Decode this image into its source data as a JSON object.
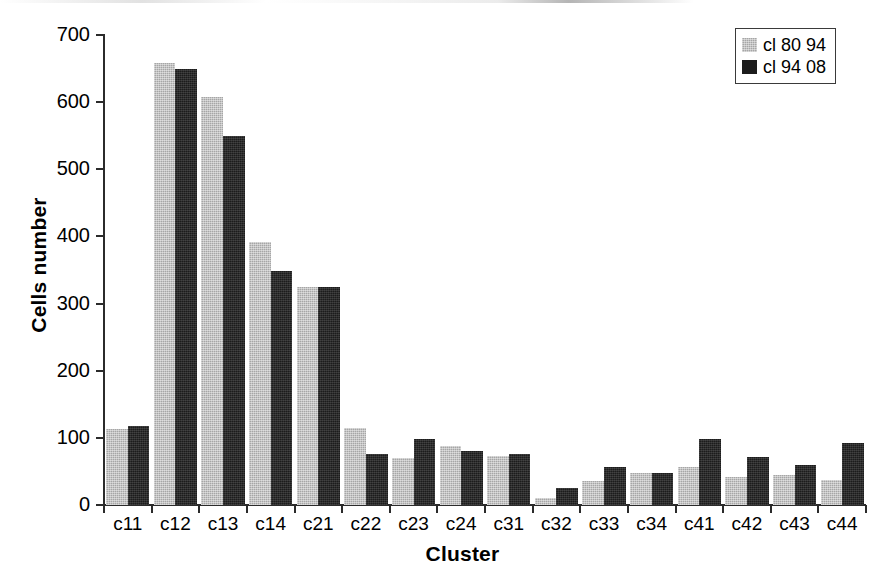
{
  "chart_data": {
    "type": "bar",
    "title": "",
    "xlabel": "Cluster",
    "ylabel": "Cells number",
    "ylim": [
      0,
      700
    ],
    "yticks": [
      0,
      100,
      200,
      300,
      400,
      500,
      600,
      700
    ],
    "grid": false,
    "legend_position": "top-right",
    "categories": [
      "c11",
      "c12",
      "c13",
      "c14",
      "c21",
      "c22",
      "c23",
      "c24",
      "c31",
      "c32",
      "c33",
      "c34",
      "c41",
      "c42",
      "c43",
      "c44"
    ],
    "series": [
      {
        "name": "cl 80 94",
        "color": "#a6a6a6",
        "values": [
          113,
          658,
          607,
          391,
          324,
          114,
          70,
          88,
          73,
          10,
          36,
          47,
          56,
          41,
          45,
          37
        ]
      },
      {
        "name": "cl 94 08",
        "color": "#1c1c1c",
        "values": [
          118,
          650,
          550,
          348,
          324,
          76,
          99,
          80,
          76,
          25,
          57,
          48,
          99,
          71,
          60,
          92
        ]
      }
    ]
  },
  "legend": {
    "entries": [
      {
        "label": "cl 80 94"
      },
      {
        "label": "cl 94 08"
      }
    ]
  }
}
